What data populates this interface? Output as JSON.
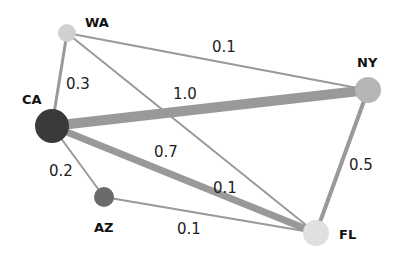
{
  "diagram": {
    "type": "weighted-network-graph",
    "nodes": [
      {
        "id": "WA",
        "label": "WA",
        "x": 67,
        "y": 33,
        "r": 9,
        "color": "#d0d0d0",
        "label_x": 85,
        "label_y": 27
      },
      {
        "id": "NY",
        "label": "NY",
        "x": 368,
        "y": 90,
        "r": 13,
        "color": "#b5b5b5",
        "label_x": 357,
        "label_y": 67
      },
      {
        "id": "CA",
        "label": "CA",
        "x": 52,
        "y": 126,
        "r": 17,
        "color": "#3a3a3a",
        "label_x": 22,
        "label_y": 104
      },
      {
        "id": "AZ",
        "label": "AZ",
        "x": 104,
        "y": 197,
        "r": 10,
        "color": "#6a6a6a",
        "label_x": 94,
        "label_y": 232
      },
      {
        "id": "FL",
        "label": "FL",
        "x": 316,
        "y": 233,
        "r": 13,
        "color": "#e0e0e0",
        "label_x": 339,
        "label_y": 239
      }
    ],
    "edges": [
      {
        "source": "WA",
        "target": "NY",
        "weight": "0.1",
        "width": 2,
        "label_x": 212,
        "label_y": 52
      },
      {
        "source": "WA",
        "target": "CA",
        "weight": "0.3",
        "width": 3,
        "label_x": 66,
        "label_y": 89
      },
      {
        "source": "WA",
        "target": "FL",
        "weight": "0.1",
        "width": 2,
        "label_x": 213,
        "label_y": 193
      },
      {
        "source": "CA",
        "target": "NY",
        "weight": "1.0",
        "width": 10,
        "label_x": 173,
        "label_y": 99
      },
      {
        "source": "CA",
        "target": "FL",
        "weight": "0.7",
        "width": 7,
        "label_x": 154,
        "label_y": 157
      },
      {
        "source": "CA",
        "target": "AZ",
        "weight": "0.2",
        "width": 2,
        "label_x": 49,
        "label_y": 176
      },
      {
        "source": "AZ",
        "target": "FL",
        "weight": "0.1",
        "width": 2,
        "label_x": 177,
        "label_y": 234
      },
      {
        "source": "NY",
        "target": "FL",
        "weight": "0.5",
        "width": 4,
        "label_x": 349,
        "label_y": 170
      }
    ],
    "edge_color": "#999999"
  }
}
